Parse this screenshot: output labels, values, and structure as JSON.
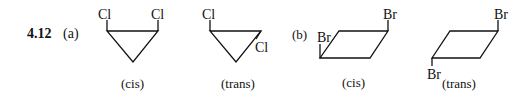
{
  "problem": {
    "number": "4.12"
  },
  "parts": [
    {
      "label": "(a)",
      "structures": [
        {
          "name": "cis",
          "caption": "(cis)",
          "substituents": [
            "Cl",
            "Cl"
          ]
        },
        {
          "name": "trans",
          "caption": "(trans)",
          "substituents": [
            "Cl",
            "Cl"
          ]
        }
      ]
    },
    {
      "label": "(b)",
      "structures": [
        {
          "name": "cis",
          "caption": "(cis)",
          "substituents": [
            "Br",
            "Br"
          ]
        },
        {
          "name": "trans",
          "caption": "(trans)",
          "substituents": [
            "Br",
            "Br"
          ]
        }
      ]
    }
  ]
}
